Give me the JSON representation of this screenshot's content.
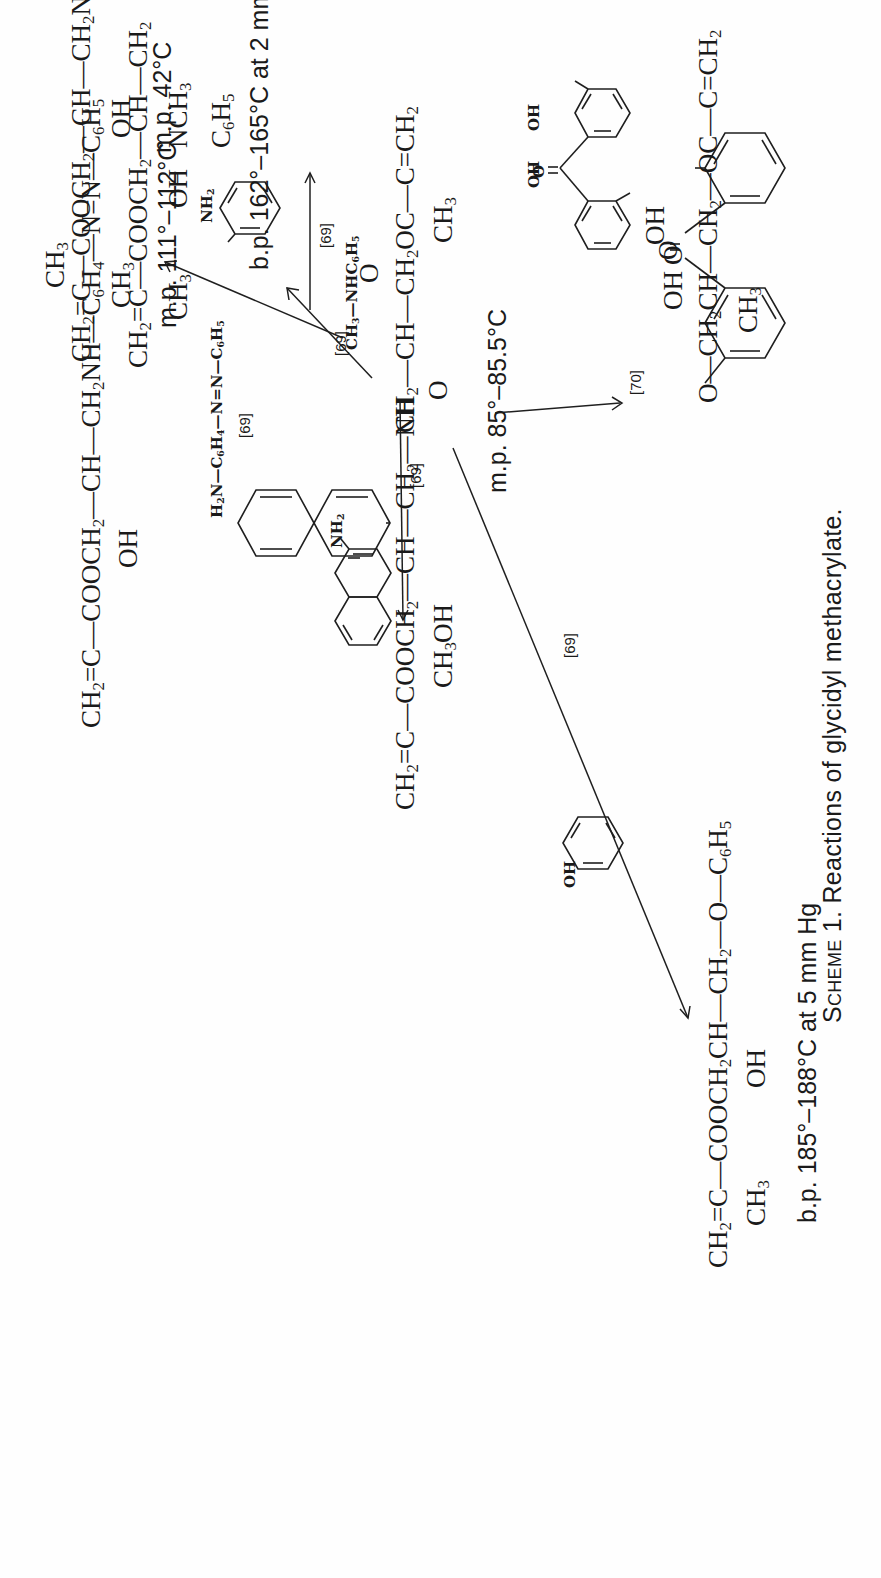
{
  "caption": {
    "label": "Scheme 1.",
    "text": "Reactions of glycidyl methacrylate."
  },
  "reactant": {
    "name": "glycidyl methacrylate",
    "carbonyl_o": "O",
    "chain": [
      "CH2",
      "CH",
      "CH2OC",
      "C",
      "CH2"
    ],
    "epoxide_o": "O",
    "methyl": "CH3"
  },
  "reactions": [
    {
      "id": "n-methylaniline",
      "reagent": "CH3—NHC6H5",
      "ref": "[69]",
      "product": "CH2=C(CH3)—COOCH2—CH(OH)—CH2—N(CH3)C6H5",
      "property": "b.p. 162°–165°C at 2 mm Hg"
    },
    {
      "id": "aniline",
      "reagent": "aniline (NH2-C6H5)",
      "reagent_label": "NH2",
      "ref": "[69]",
      "product": "CH2=C(CH3)—COOCH2—CH(OH)—CH2NHC6H5",
      "property": "m.p. 42°C"
    },
    {
      "id": "aminoazobenzene",
      "reagent": "H2N—C6H4—N=N—C6H5",
      "ref": "[69]",
      "product": "CH2=C(CH3)—COOCH2—CH(OH)—CH2NH—C6H4—N=N—C6H5",
      "property": "m.p. 111°–112°C"
    },
    {
      "id": "2-naphthylamine",
      "reagent": "2-naphthylamine",
      "reagent_label": "NH2",
      "ref": "[69]",
      "product": "CH2=C(CH3)—COOCH2—CH(OH)—CH2—NH—(2-naphthyl)",
      "property": "m.p. 85°–85.5°C"
    },
    {
      "id": "phenol",
      "reagent": "phenol",
      "reagent_label": "OH",
      "ref": "[69]",
      "product": "CH2=C(CH3)—COOCH2CH(OH)—CH2—O—C6H5",
      "property": "b.p. 185°–188°C at 5 mm Hg"
    },
    {
      "id": "2,4-dihydroxybenzophenone",
      "reagent": "2,4-dihydroxybenzophenone",
      "reagent_labels": [
        "OH",
        "OH",
        "O"
      ],
      "ref": "[70]",
      "product": "2-hydroxy-4-[CH2CH(OH)—CH2—OC(=O)—C(CH3)=CH2]oxy-benzophenone",
      "property": ""
    }
  ],
  "text": {
    "CH2": "CH",
    "CH3": "CH",
    "C6H5": "C",
    "H5": "H",
    "sub2": "2",
    "sub3": "3",
    "sub4": "4",
    "sub5": "5",
    "sub6": "6",
    "OH": "OH",
    "O": "O",
    "C": "C",
    "NH": "NH",
    "NH2": "NH",
    "N": "N",
    "COOCH": "COOCH",
    "CH": "CH",
    "OC": "OC",
    "CH2OC_a": "CH",
    "CH2OC_b": "OC",
    "NCH": "NCH",
    "H": "H",
    "H2N": "H",
    "NHC": "NHC",
    "ref69": "[69]",
    "ref70": "[70]",
    "dash": "—",
    "dbl": "=",
    "mp42": "m.p. 42°C",
    "mp111": "m.p. 111°–112°C",
    "mp85": "m.p. 85°–85.5°C",
    "bp162": "b.p. 162°–165°C at 2 mm Hg",
    "bp185": "b.p. 185°–188°C at 5 mm Hg"
  }
}
